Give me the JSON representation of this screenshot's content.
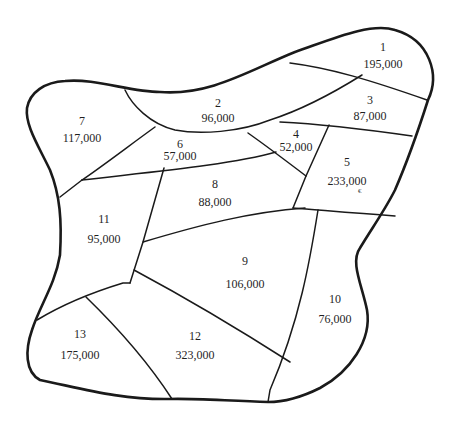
{
  "map": {
    "type": "region map with population labels",
    "regions": [
      {
        "id": "1",
        "label": "1",
        "value": "195,000",
        "num_pos": [
          383,
          41
        ],
        "val_pos": [
          383,
          58
        ]
      },
      {
        "id": "2",
        "label": "2",
        "value": "96,000",
        "num_pos": [
          218,
          97
        ],
        "val_pos": [
          218,
          112
        ]
      },
      {
        "id": "3",
        "label": "3",
        "value": "87,000",
        "num_pos": [
          370,
          94
        ],
        "val_pos": [
          370,
          110
        ]
      },
      {
        "id": "4",
        "label": "4",
        "value": "52,000",
        "num_pos": [
          296,
          128
        ],
        "val_pos": [
          296,
          141
        ]
      },
      {
        "id": "5",
        "label": "5",
        "value": "233,000",
        "num_pos": [
          347,
          156
        ],
        "val_pos": [
          347,
          175
        ]
      },
      {
        "id": "6",
        "label": "6",
        "value": "57,000",
        "num_pos": [
          180,
          138
        ],
        "val_pos": [
          180,
          150
        ]
      },
      {
        "id": "7",
        "label": "7",
        "value": "117,000",
        "num_pos": [
          82,
          115
        ],
        "val_pos": [
          82,
          132
        ]
      },
      {
        "id": "8",
        "label": "8",
        "value": "88,000",
        "num_pos": [
          215,
          178
        ],
        "val_pos": [
          215,
          196
        ]
      },
      {
        "id": "9",
        "label": "9",
        "value": "106,000",
        "num_pos": [
          245,
          255
        ],
        "val_pos": [
          245,
          278
        ]
      },
      {
        "id": "10",
        "label": "10",
        "value": "76,000",
        "num_pos": [
          335,
          293
        ],
        "val_pos": [
          335,
          313
        ]
      },
      {
        "id": "11",
        "label": "11",
        "value": "95,000",
        "num_pos": [
          104,
          213
        ],
        "val_pos": [
          104,
          233
        ]
      },
      {
        "id": "12",
        "label": "12",
        "value": "323,000",
        "num_pos": [
          195,
          330
        ],
        "val_pos": [
          195,
          349
        ]
      },
      {
        "id": "13",
        "label": "13",
        "value": "175,000",
        "num_pos": [
          80,
          328
        ],
        "val_pos": [
          80,
          349
        ]
      }
    ],
    "stray_mark": "€",
    "colors": {
      "line": "#1a1a1a",
      "text": "#1f1f1f",
      "background": "#ffffff"
    }
  }
}
